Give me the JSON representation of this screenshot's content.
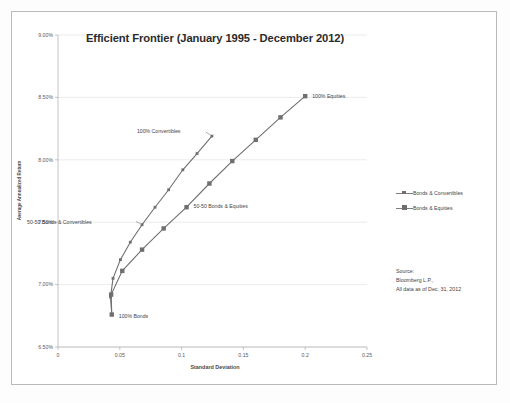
{
  "chart_data": {
    "type": "line",
    "title": "Efficient Frontier (January 1995 - December 2012)",
    "xlabel": "Standard Deviation",
    "ylabel": "Average Annualized Return",
    "xlim": [
      0,
      0.25
    ],
    "ylim": [
      6.5,
      9.0
    ],
    "xticks": [
      "0",
      "0.05",
      "0.1",
      "0.15",
      "0.2",
      "0.25"
    ],
    "xtick_values": [
      0,
      0.05,
      0.1,
      0.15,
      0.2,
      0.25
    ],
    "yticks": [
      "6.50%",
      "7.00%",
      "7.50%",
      "8.00%",
      "8.50%",
      "9.00%"
    ],
    "ytick_values": [
      6.5,
      7.0,
      7.5,
      8.0,
      8.5,
      9.0
    ],
    "grid": "horizontal",
    "legend_position": "right",
    "series": [
      {
        "name": "Bonds & Convertibles",
        "marker": "square-small",
        "color": "#6f6f6f",
        "points": [
          {
            "x": 0.0435,
            "y": 6.76
          },
          {
            "x": 0.0425,
            "y": 6.9
          },
          {
            "x": 0.0445,
            "y": 7.05
          },
          {
            "x": 0.0505,
            "y": 7.2
          },
          {
            "x": 0.0585,
            "y": 7.34
          },
          {
            "x": 0.068,
            "y": 7.48
          },
          {
            "x": 0.0785,
            "y": 7.62
          },
          {
            "x": 0.0895,
            "y": 7.76
          },
          {
            "x": 0.101,
            "y": 7.92
          },
          {
            "x": 0.1125,
            "y": 8.05
          },
          {
            "x": 0.1245,
            "y": 8.19
          }
        ]
      },
      {
        "name": "Bonds & Equities",
        "marker": "square-large",
        "color": "#6f6f6f",
        "points": [
          {
            "x": 0.0435,
            "y": 6.76
          },
          {
            "x": 0.043,
            "y": 6.92
          },
          {
            "x": 0.052,
            "y": 7.11
          },
          {
            "x": 0.068,
            "y": 7.28
          },
          {
            "x": 0.0855,
            "y": 7.45
          },
          {
            "x": 0.104,
            "y": 7.62
          },
          {
            "x": 0.1225,
            "y": 7.81
          },
          {
            "x": 0.141,
            "y": 7.99
          },
          {
            "x": 0.16,
            "y": 8.16
          },
          {
            "x": 0.18,
            "y": 8.34
          },
          {
            "x": 0.2,
            "y": 8.51
          }
        ]
      }
    ],
    "annotations": [
      {
        "text": "100% Convertibles",
        "x": 0.1245,
        "y": 8.19
      },
      {
        "text": "50-50 Bonds & Convertibles",
        "x": 0.068,
        "y": 7.48
      },
      {
        "text": "50-50 Bonds & Equities",
        "x": 0.104,
        "y": 7.62
      },
      {
        "text": "100% Equities",
        "x": 0.2,
        "y": 8.51
      },
      {
        "text": "100% Bonds",
        "x": 0.0435,
        "y": 6.76
      }
    ]
  },
  "legend": {
    "items": [
      {
        "label": "Bonds & Convertibles"
      },
      {
        "label": "Bonds & Equities"
      }
    ]
  },
  "source": {
    "line1": "Source:",
    "line2": "Bloomberg L.P.,",
    "line3": "All data as of Dec. 31, 2012"
  }
}
